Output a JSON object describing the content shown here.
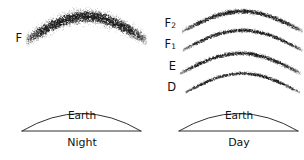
{
  "figure": {
    "background_color": "#ffffff",
    "ink_color": "#1a1a1a",
    "width": 304,
    "height": 160
  },
  "panels": [
    {
      "id": "night",
      "caption": "Night",
      "earth_word": "Earth",
      "earth_dome": {
        "x_left": 22,
        "x_right": 141,
        "baseline_y": 131,
        "apex_y": 104
      },
      "earth_word_pos": {
        "x": 82,
        "y": 119
      },
      "caption_pos": {
        "x": 82,
        "y": 146
      },
      "layers": [
        {
          "label": "F",
          "subscript": "",
          "label_pos": {
            "x": 22,
            "y": 38
          },
          "arc": {
            "x_left": 26,
            "x_right": 146,
            "apex_y": 16,
            "edge_y": 40,
            "thickness": 14,
            "density": 2600,
            "style": "diffuse-broad-band"
          }
        }
      ]
    },
    {
      "id": "day",
      "caption": "Day",
      "earth_word": "Earth",
      "earth_dome": {
        "x_left": 179,
        "x_right": 298,
        "baseline_y": 131,
        "apex_y": 104
      },
      "earth_word_pos": {
        "x": 239,
        "y": 119
      },
      "caption_pos": {
        "x": 239,
        "y": 146
      },
      "layers": [
        {
          "label": "F",
          "subscript": "2",
          "label_pos": {
            "x": 176,
            "y": 23
          },
          "arc": {
            "x_left": 182,
            "x_right": 302,
            "apex_y": 11,
            "edge_y": 31,
            "thickness": 5,
            "density": 1250,
            "style": "thin-dense-arc"
          }
        },
        {
          "label": "F",
          "subscript": "1",
          "label_pos": {
            "x": 176,
            "y": 44
          },
          "arc": {
            "x_left": 182,
            "x_right": 302,
            "apex_y": 30,
            "edge_y": 50,
            "thickness": 4,
            "density": 1050,
            "style": "thin-sparse-arc"
          }
        },
        {
          "label": "E",
          "subscript": "",
          "label_pos": {
            "x": 176,
            "y": 66
          },
          "arc": {
            "x_left": 180,
            "x_right": 300,
            "apex_y": 53,
            "edge_y": 73,
            "thickness": 4.5,
            "density": 1150,
            "style": "thin-dense-arc"
          }
        },
        {
          "label": "D",
          "subscript": "",
          "label_pos": {
            "x": 176,
            "y": 87
          },
          "arc": {
            "x_left": 185,
            "x_right": 299,
            "apex_y": 73,
            "edge_y": 92,
            "thickness": 3.5,
            "density": 900,
            "style": "thin-sparse-arc"
          }
        }
      ]
    }
  ]
}
